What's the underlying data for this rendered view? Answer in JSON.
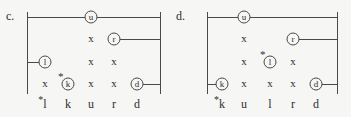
{
  "figure": {
    "background": "#f6f6f4",
    "ink": "#4a4a4a",
    "diagrams": [
      {
        "label": "c.",
        "columns": [
          "l",
          "k",
          "u",
          "r",
          "d"
        ],
        "col_x": [
          45,
          68,
          91,
          114,
          137
        ],
        "row_y": [
          17,
          39,
          62,
          84
        ],
        "left_rail_x": 27,
        "right_rail_x": 160,
        "rail_top_y": 12,
        "rail_bottom_y": 94,
        "bottom_label_y": 98,
        "circles": [
          {
            "letter": "u",
            "col": "u",
            "row": 0,
            "line_left": true,
            "line_right": true,
            "star": false
          },
          {
            "letter": "r",
            "col": "r",
            "row": 1,
            "line_left": false,
            "line_right": true,
            "star": false
          },
          {
            "letter": "l",
            "col": "l",
            "row": 2,
            "line_left": true,
            "line_right": false,
            "star": false
          },
          {
            "letter": "k",
            "col": "k",
            "row": 3,
            "line_left": false,
            "line_right": false,
            "star": true
          },
          {
            "letter": "d",
            "col": "d",
            "row": 3,
            "line_left": false,
            "line_right": true,
            "star": false
          }
        ],
        "x_marks": [
          {
            "col": "u",
            "row": 1
          },
          {
            "col": "u",
            "row": 2
          },
          {
            "col": "r",
            "row": 2
          },
          {
            "col": "l",
            "row": 3
          },
          {
            "col": "u",
            "row": 3
          },
          {
            "col": "r",
            "row": 3
          }
        ],
        "bottom_labels": [
          {
            "text": "l",
            "star": true
          },
          {
            "text": "k",
            "star": false
          },
          {
            "text": "u",
            "star": false
          },
          {
            "text": "r",
            "star": false
          },
          {
            "text": "d",
            "star": false
          }
        ]
      },
      {
        "label": "d.",
        "columns": [
          "k",
          "u",
          "l",
          "r",
          "d"
        ],
        "col_x": [
          222,
          244,
          270,
          293,
          316
        ],
        "row_y": [
          17,
          39,
          62,
          84
        ],
        "left_rail_x": 207,
        "right_rail_x": 337,
        "rail_top_y": 12,
        "rail_bottom_y": 94,
        "bottom_label_y": 98,
        "circles": [
          {
            "letter": "u",
            "col": "u",
            "row": 0,
            "line_left": true,
            "line_right": true,
            "star": false
          },
          {
            "letter": "r",
            "col": "r",
            "row": 1,
            "line_left": false,
            "line_right": true,
            "star": false
          },
          {
            "letter": "l",
            "col": "l",
            "row": 2,
            "line_left": false,
            "line_right": false,
            "star": true
          },
          {
            "letter": "k",
            "col": "k",
            "row": 3,
            "line_left": true,
            "line_right": false,
            "star": false
          },
          {
            "letter": "d",
            "col": "d",
            "row": 3,
            "line_left": false,
            "line_right": true,
            "star": false
          }
        ],
        "x_marks": [
          {
            "col": "u",
            "row": 1
          },
          {
            "col": "u",
            "row": 2
          },
          {
            "col": "r",
            "row": 2
          },
          {
            "col": "u",
            "row": 3
          },
          {
            "col": "l",
            "row": 3
          },
          {
            "col": "r",
            "row": 3
          }
        ],
        "bottom_labels": [
          {
            "text": "k",
            "star": true
          },
          {
            "text": "u",
            "star": false
          },
          {
            "text": "l",
            "star": false
          },
          {
            "text": "r",
            "star": false
          },
          {
            "text": "d",
            "star": false
          }
        ]
      }
    ]
  }
}
